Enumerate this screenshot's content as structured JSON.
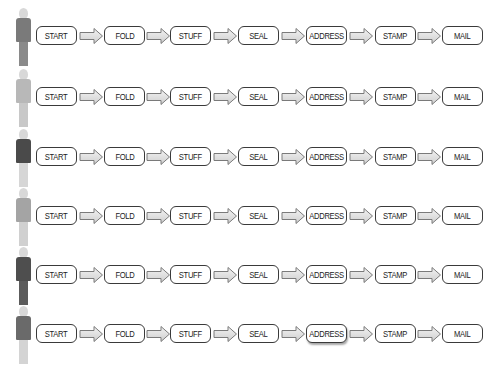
{
  "diagram": {
    "title": "",
    "steps": [
      "START",
      "FOLD",
      "STUFF",
      "SEAL",
      "ADDRESS",
      "STAMP",
      "MAIL"
    ],
    "rows": [
      {
        "figure": {
          "torso": "#7a7a7a",
          "legs": "#8a8a8a"
        },
        "highlight_step": null
      },
      {
        "figure": {
          "torso": "#b8b8b8",
          "legs": "#c8c8c8"
        },
        "highlight_step": null
      },
      {
        "figure": {
          "torso": "#4a4a4a",
          "legs": "#d6d6d6"
        },
        "highlight_step": null
      },
      {
        "figure": {
          "torso": "#a4a4a4",
          "legs": "#d0d0d0"
        },
        "highlight_step": null
      },
      {
        "figure": {
          "torso": "#4e4e4e",
          "legs": "#5c5c5c"
        },
        "highlight_step": null
      },
      {
        "figure": {
          "torso": "#6a6a6a",
          "legs": "#d4d4d4"
        },
        "highlight_step": "ADDRESS"
      }
    ],
    "colors": {
      "box_border": "#3a3a3a",
      "box_fill": "#ffffff",
      "arrow_outline": "#7a7a7a",
      "arrow_fill": "#e2e2e2",
      "text": "#222222"
    }
  },
  "rows": {
    "0": {
      "steps": [
        "START",
        "FOLD",
        "STUFF",
        "SEAL",
        "ADDRESS",
        "STAMP",
        "MAIL"
      ]
    },
    "1": {
      "steps": [
        "START",
        "FOLD",
        "STUFF",
        "SEAL",
        "ADDRESS",
        "STAMP",
        "MAIL"
      ]
    },
    "2": {
      "steps": [
        "START",
        "FOLD",
        "STUFF",
        "SEAL",
        "ADDRESS",
        "STAMP",
        "MAIL"
      ]
    },
    "3": {
      "steps": [
        "START",
        "FOLD",
        "STUFF",
        "SEAL",
        "ADDRESS",
        "STAMP",
        "MAIL"
      ]
    },
    "4": {
      "steps": [
        "START",
        "FOLD",
        "STUFF",
        "SEAL",
        "ADDRESS",
        "STAMP",
        "MAIL"
      ]
    },
    "5": {
      "steps": [
        "START",
        "FOLD",
        "STUFF",
        "SEAL",
        "ADDRESS",
        "STAMP",
        "MAIL"
      ]
    }
  }
}
